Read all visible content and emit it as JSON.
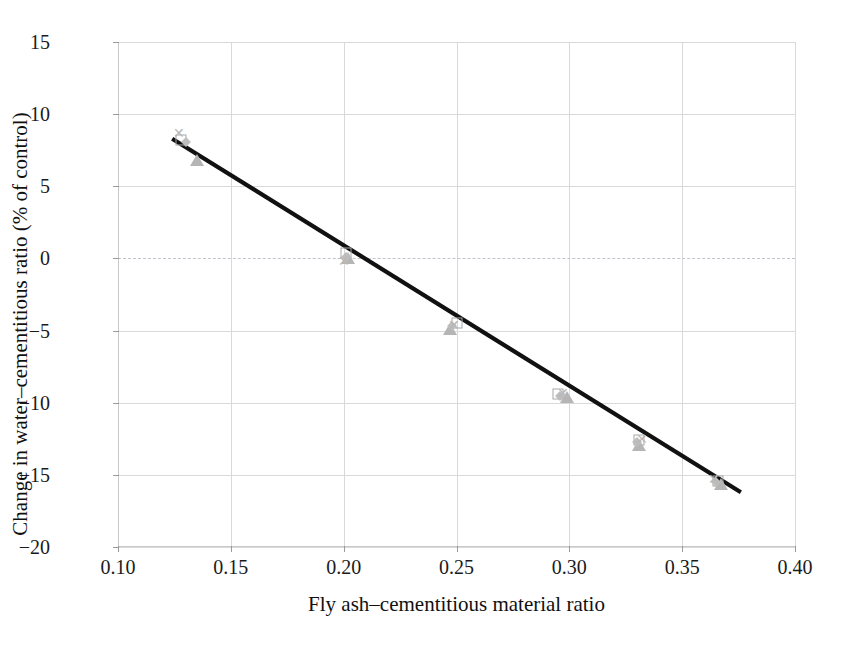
{
  "chart_data": {
    "type": "scatter",
    "title": "",
    "xlabel": "Fly ash–cementitious material ratio",
    "ylabel": "Change in water–cementitious ratio (% of control)",
    "xlim": [
      0.1,
      0.4
    ],
    "ylim": [
      -20,
      15
    ],
    "xticks": [
      "0.10",
      "0.15",
      "0.20",
      "0.25",
      "0.30",
      "0.35",
      "0.40"
    ],
    "xtick_values": [
      0.1,
      0.15,
      0.2,
      0.25,
      0.3,
      0.35,
      0.4
    ],
    "yticks": [
      "15",
      "10",
      "5",
      "0",
      "−5",
      "−10",
      "−15",
      "−20"
    ],
    "ytick_values": [
      15,
      10,
      5,
      0,
      -5,
      -10,
      -15,
      -20
    ],
    "grid": "both",
    "legend": "none",
    "zero_reference_line": true,
    "series": [
      {
        "name": "series-square-open",
        "marker": "square-open",
        "points": [
          {
            "x": 0.128,
            "y": 8.2
          },
          {
            "x": 0.201,
            "y": 0.4
          },
          {
            "x": 0.25,
            "y": -4.5
          },
          {
            "x": 0.295,
            "y": -9.4
          },
          {
            "x": 0.331,
            "y": -12.6
          },
          {
            "x": 0.366,
            "y": -15.4
          }
        ]
      },
      {
        "name": "series-triangle",
        "marker": "triangle-filled",
        "points": [
          {
            "x": 0.135,
            "y": 6.8
          },
          {
            "x": 0.202,
            "y": 0.0
          },
          {
            "x": 0.247,
            "y": -4.9
          },
          {
            "x": 0.299,
            "y": -9.6
          },
          {
            "x": 0.331,
            "y": -12.9
          },
          {
            "x": 0.367,
            "y": -15.6
          }
        ]
      },
      {
        "name": "series-diamond",
        "marker": "diamond-filled",
        "points": [
          {
            "x": 0.13,
            "y": 8.1
          },
          {
            "x": 0.201,
            "y": 0.1
          },
          {
            "x": 0.248,
            "y": -4.7
          },
          {
            "x": 0.296,
            "y": -9.5
          },
          {
            "x": 0.33,
            "y": -12.7
          },
          {
            "x": 0.365,
            "y": -15.5
          }
        ]
      },
      {
        "name": "series-cross",
        "marker": "cross",
        "points": [
          {
            "x": 0.127,
            "y": 8.7
          },
          {
            "x": 0.2,
            "y": -0.2
          },
          {
            "x": 0.249,
            "y": -4.6
          },
          {
            "x": 0.297,
            "y": -9.3
          },
          {
            "x": 0.332,
            "y": -12.5
          },
          {
            "x": 0.364,
            "y": -15.3
          }
        ]
      }
    ],
    "trendline": {
      "name": "linear-fit",
      "color": "#111111",
      "x_start": 0.124,
      "y_start": 8.3,
      "x_end": 0.376,
      "y_end": -16.2,
      "slope": -97.2,
      "intercept": 20.35
    }
  },
  "axis_titles": {
    "x": "Fly ash–cementitious material ratio",
    "y": "Change in water–cementitious ratio (% of control)"
  },
  "colors": {
    "grid": "#d9d9d9",
    "axis": "#c9c9c9",
    "zero_line": "#c0c4cc",
    "trendline": "#111111",
    "marker_gray": "#b5b5b5",
    "text": "#1a1a1a"
  }
}
